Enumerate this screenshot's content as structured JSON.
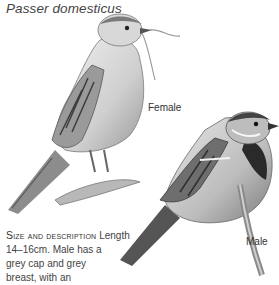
{
  "page": {
    "scientific_name": "Passer domesticus",
    "labels": {
      "female": "Female",
      "male": "Male"
    },
    "description": {
      "heading": "Size and description",
      "lines": [
        "Length",
        "14–16cm. Male has a",
        "grey cap and grey",
        "breast, with an"
      ]
    }
  },
  "illustrations": [
    {
      "name": "female-sparrow",
      "subject": "Female house sparrow holding nesting grass"
    },
    {
      "name": "male-sparrow",
      "subject": "Male house sparrow perched on twig"
    }
  ],
  "colors": {
    "text": "#3a3a3a",
    "background": "#ffffff"
  }
}
